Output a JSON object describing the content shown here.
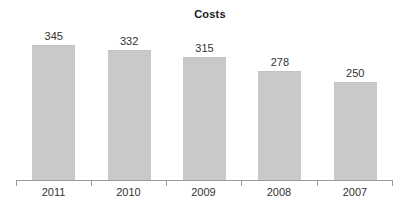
{
  "chart_data": {
    "type": "bar",
    "title": "Costs",
    "xlabel": "",
    "ylabel": "",
    "categories": [
      "2011",
      "2010",
      "2009",
      "2008",
      "2007"
    ],
    "values": [
      345,
      332,
      315,
      278,
      250
    ],
    "series": [
      {
        "name": "Costs",
        "values": [
          345,
          332,
          315,
          278,
          250
        ]
      }
    ],
    "ylim": [
      0,
      400
    ],
    "grid": false,
    "legend": false,
    "legend_position": "none",
    "bar_color": "#c9c9c9",
    "axis_color": "#9a9a9a",
    "text_color": "#333333",
    "title_color": "#1b1b1b",
    "background_color": "#ffffff",
    "value_labels_shown": true,
    "y_axis_shown": false,
    "x_axis_shown": true
  }
}
